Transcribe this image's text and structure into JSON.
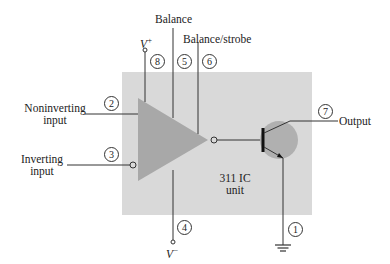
{
  "diagram": {
    "unit_label_line1": "311 IC",
    "unit_label_line2": "unit",
    "labels": {
      "balance": "Balance",
      "balance_strobe": "Balance/strobe",
      "noninverting_line1": "Noninverting",
      "noninverting_line2": "input",
      "inverting_line1": "Inverting",
      "inverting_line2": "input",
      "output": "Output",
      "v_plus": "V",
      "v_plus_sup": "+",
      "v_minus": "V",
      "v_minus_sup": "−"
    },
    "pins": {
      "p1": "1",
      "p2": "2",
      "p3": "3",
      "p4": "4",
      "p5": "5",
      "p6": "6",
      "p7": "7",
      "p8": "8"
    },
    "colors": {
      "box": "#d9d9d9",
      "triangle": "#a8a8a8",
      "transistor_circle": "#b0b0b0",
      "lines": "#333333"
    }
  }
}
